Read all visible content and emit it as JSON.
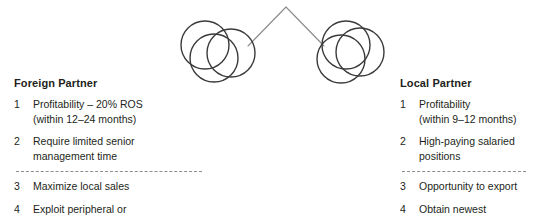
{
  "diagram": {
    "type": "venn-cluster-chevron",
    "stroke_color": "#3a3a3c",
    "chevron_color": "#8a8a8d",
    "background": "#ffffff",
    "chevron": {
      "apex": [
        286,
        7
      ],
      "left_end": [
        248,
        46
      ],
      "right_end": [
        324,
        46
      ]
    },
    "left_cluster": {
      "name": "foreign-partner-circles",
      "circles": [
        {
          "cx": 205,
          "cy": 45,
          "r": 24
        },
        {
          "cx": 214,
          "cy": 58,
          "r": 24
        },
        {
          "cx": 231,
          "cy": 53,
          "r": 24
        }
      ]
    },
    "right_cluster": {
      "name": "local-partner-circles",
      "circles": [
        {
          "cx": 346,
          "cy": 45,
          "r": 24
        },
        {
          "cx": 341,
          "cy": 59,
          "r": 24
        },
        {
          "cx": 360,
          "cy": 52,
          "r": 24
        }
      ]
    }
  },
  "columns": {
    "foreign": {
      "heading": "Foreign Partner",
      "separator_after_index": 1,
      "items": [
        {
          "number": "1",
          "text": "Profitability – 20% ROS\n(within 12–24 months)"
        },
        {
          "number": "2",
          "text": "Require limited senior\nmanagement time"
        },
        {
          "number": "3",
          "text": "Maximize local sales"
        },
        {
          "number": "4",
          "text": "Exploit peripheral or\nmature technology"
        }
      ]
    },
    "local": {
      "heading": "Local Partner",
      "separator_after_index": 1,
      "items": [
        {
          "number": "1",
          "text": "Profitability\n(within 9–12 months)"
        },
        {
          "number": "2",
          "text": "High-paying salaried\npositions"
        },
        {
          "number": "3",
          "text": "Opportunity to export"
        },
        {
          "number": "4",
          "text": "Obtain newest\ntechnology"
        }
      ]
    }
  }
}
